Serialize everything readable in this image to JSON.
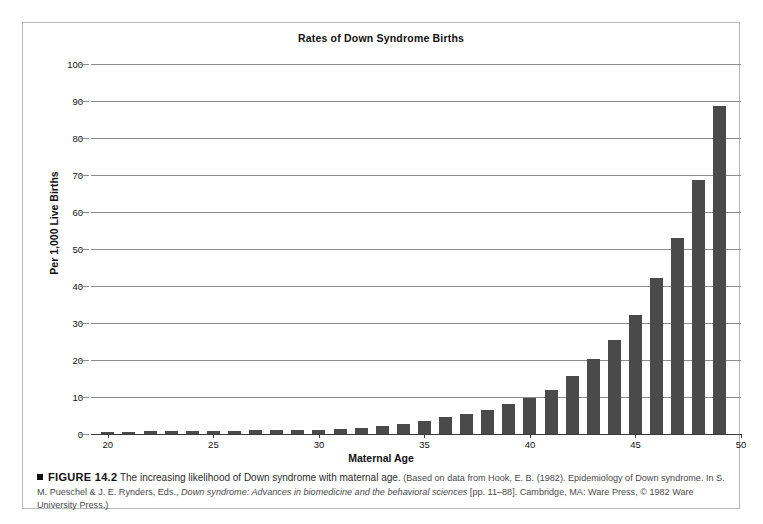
{
  "figure": {
    "title": "Rates of Down Syndrome Births",
    "caption": {
      "marker": "square-bullet",
      "figure_label": "FIGURE 14.2",
      "lede": "The increasing likelihood of Down syndrome with maternal age.",
      "source_prefix": "(Based on data from Hook, E. B. (1982). Epidemiology of Down syndrome. In S. M. Pueschel & J. E. Rynders, Eds., ",
      "source_italic": "Down syndrome: Advances in biomedicine and the behavioral sciences",
      "source_suffix": " [pp. 11–88]. Cambridge, MA: Ware Press, © 1982 Ware University Press.)"
    }
  },
  "chart_data": {
    "type": "bar",
    "title": "Rates of Down Syndrome Births",
    "xlabel": "Maternal Age",
    "ylabel": "Per 1,000 Live Births",
    "xlim": [
      19.2,
      50
    ],
    "ylim": [
      0,
      100
    ],
    "ytick_values": [
      0,
      10,
      20,
      30,
      40,
      50,
      60,
      70,
      80,
      90,
      100
    ],
    "ytick_labels": [
      "0",
      "10",
      "20",
      "30",
      "40",
      "50",
      "60",
      "70",
      "80",
      "90",
      "100"
    ],
    "xtick_values": [
      20,
      25,
      30,
      35,
      40,
      45,
      50
    ],
    "xtick_labels": [
      "20",
      "25",
      "30",
      "35",
      "40",
      "45",
      "50"
    ],
    "grid": "horizontal",
    "legend": "none",
    "bar_color": "#4a4a4a",
    "categories": [
      20,
      21,
      22,
      23,
      24,
      25,
      26,
      27,
      28,
      29,
      30,
      31,
      32,
      33,
      34,
      35,
      36,
      37,
      38,
      39,
      40,
      41,
      42,
      43,
      44,
      45,
      46,
      47,
      48,
      49
    ],
    "values": [
      0.6,
      0.6,
      0.7,
      0.7,
      0.8,
      0.9,
      0.9,
      1.0,
      1.0,
      1.1,
      1.2,
      1.4,
      1.7,
      2.2,
      2.8,
      3.6,
      4.5,
      5.3,
      6.5,
      8.2,
      9.8,
      12.0,
      15.6,
      20.3,
      25.4,
      32.2,
      42.1,
      52.9,
      68.6,
      88.7
    ]
  }
}
